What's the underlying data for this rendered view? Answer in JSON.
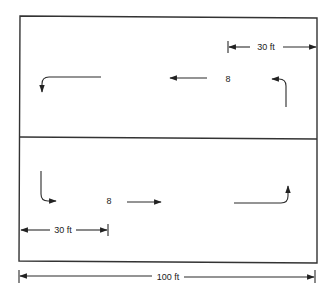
{
  "diagram": {
    "type": "traffic-flow-layout",
    "overall_width_label": "100 ft",
    "top_lane": {
      "label": "8",
      "direction": "right-to-left",
      "offset_dimension_label": "30 ft",
      "offset_side": "right"
    },
    "bottom_lane": {
      "label": "8",
      "direction": "left-to-right",
      "offset_dimension_label": "30 ft",
      "offset_side": "left"
    }
  }
}
